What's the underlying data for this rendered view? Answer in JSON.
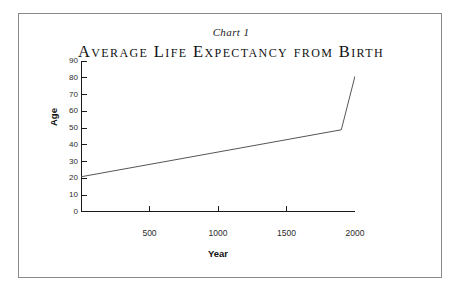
{
  "figure": {
    "caption": "Chart 1",
    "border_color": "#8a8a8a"
  },
  "chart_data": {
    "type": "line",
    "title": "Average Life Expectancy from Birth",
    "subtitle": "Chart 1",
    "xlabel": "Year",
    "ylabel": "Age",
    "xlim": [
      0,
      2000
    ],
    "ylim": [
      0,
      90
    ],
    "xticks": [
      500,
      1000,
      1500,
      2000
    ],
    "xtick_labels": [
      "500",
      "1000",
      "1500",
      "2000"
    ],
    "yticks": [
      0,
      10,
      20,
      30,
      40,
      50,
      60,
      70,
      80,
      90
    ],
    "ytick_labels": [
      "0",
      "10",
      "20",
      "30",
      "40",
      "50",
      "60",
      "70",
      "80",
      "90"
    ],
    "grid": false,
    "legend": null,
    "line_color": "#555555",
    "series": [
      {
        "name": "Average life expectancy from birth",
        "x": [
          0,
          1900,
          2000
        ],
        "values": [
          21,
          49,
          81
        ]
      }
    ]
  }
}
